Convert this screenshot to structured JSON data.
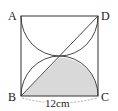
{
  "figure": {
    "vertices": {
      "A": {
        "label": "A"
      },
      "B": {
        "label": "B"
      },
      "C": {
        "label": "C"
      },
      "D": {
        "label": "D"
      }
    },
    "side_length_label": "12cm",
    "colors": {
      "stroke": "#333333",
      "shade": "#d9d9d9",
      "dimension_line": "#888888"
    }
  }
}
